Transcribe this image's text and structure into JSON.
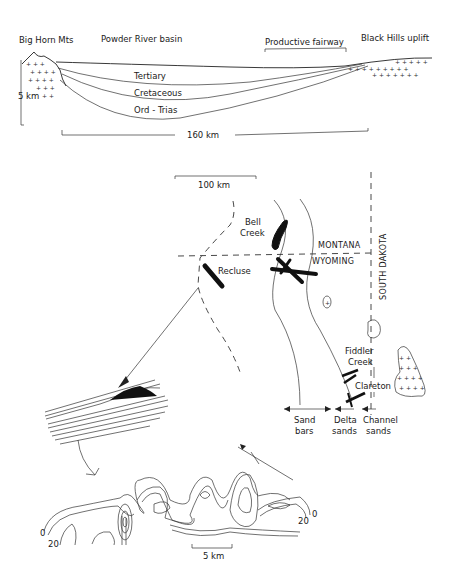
{
  "cross_section": {
    "labels": {
      "big_horn": "Big Horn Mts",
      "powder_river": "Powder River basin",
      "fairway": "Productive fairway",
      "black_hills": "Black Hills uplift",
      "tertiary": "Tertiary",
      "cretaceous": "Cretaceous",
      "ord_trias": "Ord - Trias",
      "vertical_scale": "5 km",
      "horizontal_scale": "160 km"
    }
  },
  "map": {
    "scale": "100 km",
    "fields": {
      "bell_creek_1": "Bell",
      "bell_creek_2": "Creek",
      "recluse": "Recluse",
      "fiddler_1": "Fiddler",
      "fiddler_2": "Creek",
      "clareton": "Clareton"
    },
    "states": {
      "montana": "MONTANA",
      "wyoming": "WYOMING",
      "south_dakota": "SOUTH  DAKOTA"
    },
    "facies": {
      "sand_1": "Sand",
      "sand_2": "bars",
      "delta_1": "Delta",
      "delta_2": "sands",
      "channel_1": "Channel",
      "channel_2": "sands"
    }
  },
  "isopach": {
    "contour_0_left": "0",
    "contour_20_left": "20",
    "contour_0_right": "0",
    "contour_20_right": "20",
    "scale": "5 km"
  },
  "colors": {
    "ink": "#1a1a1a",
    "paper": "#ffffff"
  }
}
